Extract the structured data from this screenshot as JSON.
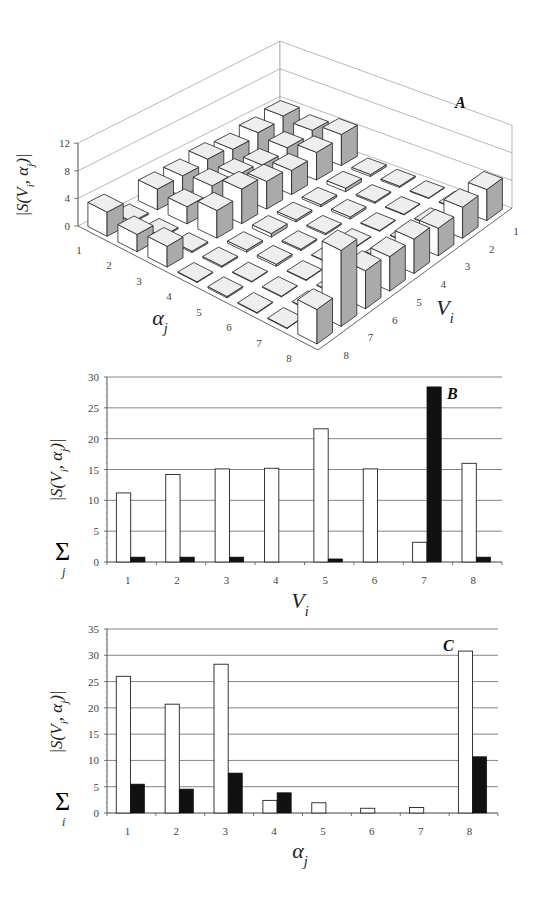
{
  "chart_data": [
    {
      "id": "A",
      "type": "bar3d",
      "panel_label": "A",
      "zlabel": "|S(V_i, α_j)|",
      "xlabel": "α_j",
      "ylabel": "V_i",
      "zlim": [
        0,
        12
      ],
      "z_ticks": [
        "0",
        "4",
        "8",
        "12"
      ],
      "x_ticks": [
        "1",
        "2",
        "3",
        "4",
        "5",
        "6",
        "7",
        "8"
      ],
      "y_ticks": [
        "1",
        "2",
        "3",
        "4",
        "5",
        "6",
        "7",
        "8"
      ],
      "note": "rows indexed by α_j (1..8), columns by V_i (1..8); heights estimated",
      "values": [
        [
          4.0,
          3.5,
          3.0,
          3.5,
          3.0,
          3.0,
          0.2,
          3.5
        ],
        [
          3.5,
          3.0,
          2.5,
          3.0,
          3.5,
          2.5,
          0.2,
          2.5
        ],
        [
          4.5,
          4.0,
          3.5,
          4.0,
          5.0,
          4.0,
          0.2,
          3.0
        ],
        [
          0.3,
          0.5,
          0.3,
          0.3,
          0.5,
          0.3,
          0.2,
          0.1
        ],
        [
          0.2,
          0.2,
          0.3,
          0.2,
          0.2,
          0.3,
          0.1,
          0.2
        ],
        [
          0.1,
          0.1,
          0.1,
          0.1,
          0.1,
          0.1,
          0.1,
          0.1
        ],
        [
          0.1,
          0.1,
          0.1,
          0.1,
          0.1,
          0.1,
          0.1,
          0.1
        ],
        [
          4.5,
          4.5,
          4.0,
          5.0,
          5.0,
          5.5,
          11.0,
          5.0
        ]
      ]
    },
    {
      "id": "B",
      "type": "bar",
      "panel_label": "B",
      "categories": [
        "1",
        "2",
        "3",
        "4",
        "5",
        "6",
        "7",
        "8"
      ],
      "xlabel": "V_i",
      "ylabel": "Σ_j |S(V_i, α_j)|",
      "ylim": [
        0,
        30
      ],
      "y_ticks": [
        "0",
        "5",
        "10",
        "15",
        "20",
        "25",
        "30"
      ],
      "grid": true,
      "series": [
        {
          "name": "white",
          "color": "#ffffff",
          "values": [
            11.2,
            14.2,
            15.1,
            15.2,
            21.6,
            15.1,
            3.2,
            16.0
          ]
        },
        {
          "name": "black",
          "color": "#111111",
          "values": [
            0.8,
            0.8,
            0.8,
            0.0,
            0.5,
            0.0,
            28.4,
            0.8
          ]
        }
      ]
    },
    {
      "id": "C",
      "type": "bar",
      "panel_label": "C",
      "categories": [
        "1",
        "2",
        "3",
        "4",
        "5",
        "6",
        "7",
        "8"
      ],
      "xlabel": "α_j",
      "ylabel": "Σ_i |S(V_i, α_j)|",
      "ylim": [
        0,
        35
      ],
      "y_ticks": [
        "0",
        "5",
        "10",
        "15",
        "20",
        "25",
        "30",
        "35"
      ],
      "grid": true,
      "series": [
        {
          "name": "white",
          "color": "#ffffff",
          "values": [
            26.0,
            20.7,
            28.3,
            2.4,
            1.95,
            0.9,
            1.05,
            30.8
          ]
        },
        {
          "name": "black",
          "color": "#111111",
          "values": [
            5.5,
            4.55,
            7.6,
            3.85,
            0.0,
            0.0,
            0.0,
            10.7
          ]
        }
      ]
    }
  ]
}
